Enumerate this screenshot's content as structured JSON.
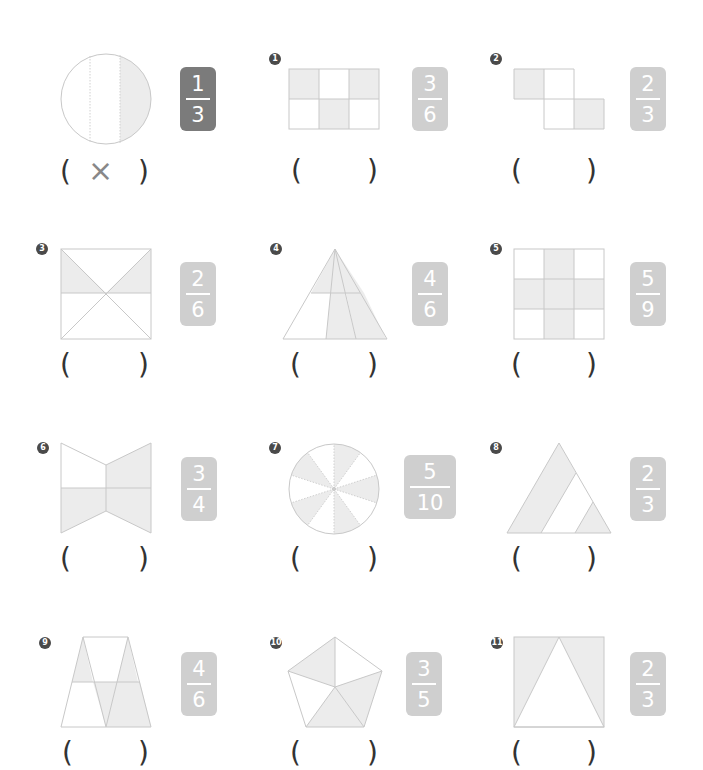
{
  "worksheet": {
    "example": {
      "fraction": {
        "numerator": "1",
        "denominator": "3"
      },
      "answer": "×",
      "open": "(",
      "close": ")"
    },
    "problems": [
      {
        "label": "1",
        "shape": "rectangle-2x3",
        "fraction": {
          "numerator": "3",
          "denominator": "6"
        },
        "open": "(",
        "close": ")",
        "answer": ""
      },
      {
        "label": "2",
        "shape": "z-tetromino",
        "fraction": {
          "numerator": "2",
          "denominator": "3"
        },
        "open": "(",
        "close": ")",
        "answer": ""
      },
      {
        "label": "3",
        "shape": "square-with-diagonals",
        "fraction": {
          "numerator": "2",
          "denominator": "6"
        },
        "open": "(",
        "close": ")",
        "answer": ""
      },
      {
        "label": "4",
        "shape": "triangle",
        "fraction": {
          "numerator": "4",
          "denominator": "6"
        },
        "open": "(",
        "close": ")",
        "answer": ""
      },
      {
        "label": "5",
        "shape": "grid-3x3",
        "fraction": {
          "numerator": "5",
          "denominator": "9"
        },
        "open": "(",
        "close": ")",
        "answer": ""
      },
      {
        "label": "6",
        "shape": "bowtie",
        "fraction": {
          "numerator": "3",
          "denominator": "4"
        },
        "open": "(",
        "close": ")",
        "answer": ""
      },
      {
        "label": "7",
        "shape": "circle-10-sectors",
        "fraction": {
          "numerator": "5",
          "denominator": "10"
        },
        "open": "(",
        "close": ")",
        "answer": ""
      },
      {
        "label": "8",
        "shape": "triangle-split",
        "fraction": {
          "numerator": "2",
          "denominator": "3"
        },
        "open": "(",
        "close": ")",
        "answer": ""
      },
      {
        "label": "9",
        "shape": "trapezoid",
        "fraction": {
          "numerator": "4",
          "denominator": "6"
        },
        "open": "(",
        "close": ")",
        "answer": ""
      },
      {
        "label": "10",
        "shape": "pentagon",
        "fraction": {
          "numerator": "3",
          "denominator": "5"
        },
        "open": "(",
        "close": ")",
        "answer": ""
      },
      {
        "label": "11",
        "shape": "square-with-triangle",
        "fraction": {
          "numerator": "2",
          "denominator": "3"
        },
        "open": "(",
        "close": ")",
        "answer": ""
      }
    ]
  },
  "colors": {
    "badge_example": "#7b7b7b",
    "badge": "#cfcfcf",
    "shade": "#ececec",
    "line": "#c8c8c8"
  }
}
